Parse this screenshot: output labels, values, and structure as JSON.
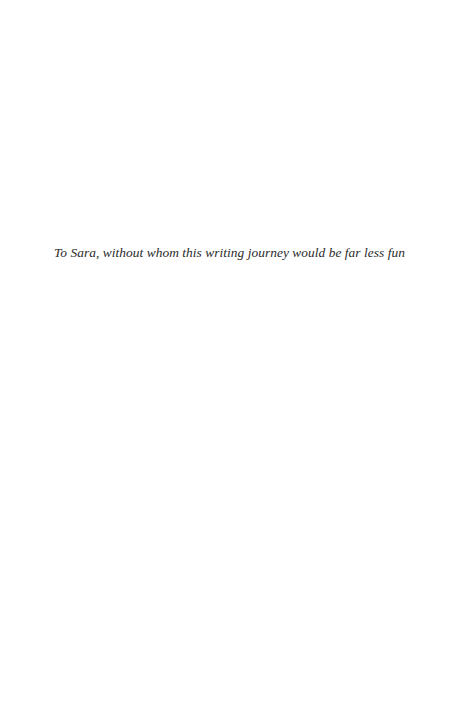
{
  "page": {
    "type": "dedication",
    "background": "#ffffff",
    "text_color": "#2a2a2a"
  },
  "dedication": {
    "text": "To Sara, without whom this writing journey would be far less fun"
  }
}
